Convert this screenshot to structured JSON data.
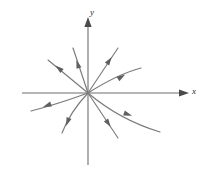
{
  "figure": {
    "background_color": "#ffffff",
    "width": 216,
    "height": 174
  },
  "axes": {
    "x_label": "x",
    "y_label": "y",
    "axis_color": "#6e6e6e",
    "origin": {
      "x": 88,
      "y": 93
    },
    "x_axis": {
      "start_x": 22,
      "end_x": 186,
      "y": 93,
      "arrow": "right"
    },
    "y_axis": {
      "x": 88,
      "start_y": 165,
      "end_y": 20,
      "arrow": "up"
    }
  },
  "chart_data": {
    "type": "scatter",
    "xlabel": "x",
    "ylabel": "y",
    "grid": false,
    "legend": null,
    "equilibrium": {
      "type": "stable node (sink)",
      "x": 0,
      "y": 0
    },
    "flow_direction": "inward toward origin",
    "trajectory_color": "#7a7a7a",
    "trajectory_count": 8,
    "arrowhead_count": 8,
    "trajectories": [
      {
        "name": "ray-upper-left-shallow",
        "shape": "straight",
        "path": "M 48 60 L 88 93",
        "arrow_at": {
          "x": 62,
          "y": 71,
          "angle": 140
        }
      },
      {
        "name": "ray-upper-left-steep",
        "shape": "straight",
        "path": "M 73 48 L 88 93",
        "arrow_at": {
          "x": 79,
          "y": 68,
          "angle": 108
        }
      },
      {
        "name": "ray-upper-right-steep",
        "shape": "straight",
        "path": "M 118 48 L 88 93",
        "arrow_at": {
          "x": 107,
          "y": 64,
          "angle": 56
        }
      },
      {
        "name": "curve-upper-right",
        "shape": "curved",
        "path": "M 141 68 Q 118 74 88 93",
        "arrow_at": {
          "x": 118,
          "y": 79,
          "angle": 32
        }
      },
      {
        "name": "curve-left-lower",
        "shape": "curved",
        "path": "M 31 111 Q 58 104 88 93",
        "arrow_at": {
          "x": 51,
          "y": 104,
          "angle": 200
        }
      },
      {
        "name": "curve-lower-left",
        "shape": "curved",
        "path": "M 62 133 Q 70 112 88 93",
        "arrow_at": {
          "x": 69,
          "y": 118,
          "angle": 250
        }
      },
      {
        "name": "ray-lower-right",
        "shape": "straight",
        "path": "M 118 138 L 88 93",
        "arrow_at": {
          "x": 106,
          "y": 120,
          "angle": 304
        }
      },
      {
        "name": "curve-lower-right",
        "shape": "curved",
        "path": "M 160 132 Q 120 120 88 93",
        "arrow_at": {
          "x": 124,
          "y": 113,
          "angle": 341
        }
      }
    ]
  }
}
